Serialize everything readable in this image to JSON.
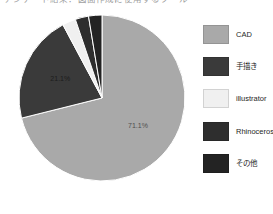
{
  "chart_data": {
    "type": "pie",
    "title": "アンケート結果：図面作成に使用するツール",
    "title_truncated": true,
    "categories": [
      "CAD",
      "手描き",
      "illustrator",
      "Rhinoceross",
      "その他"
    ],
    "values": [
      71.1,
      21.1,
      2.6,
      2.6,
      2.6
    ],
    "data_labels": [
      "71.1%",
      "21.1%",
      "",
      "",
      ""
    ],
    "visible_data_labels": [
      "71.1%",
      "21.1%"
    ],
    "colors": [
      "#a9a9a9",
      "#3a3a3a",
      "#f0f0f0",
      "#2e2e2e",
      "#232323"
    ],
    "legend": {
      "position": "right",
      "entries": [
        {
          "label": "CAD",
          "color": "#a9a9a9"
        },
        {
          "label": "手描き",
          "color": "#3a3a3a"
        },
        {
          "label": "illustrator",
          "color": "#f0f0f0"
        },
        {
          "label": "Rhinoceross",
          "color": "#2e2e2e"
        },
        {
          "label": "その他",
          "color": "#232323"
        }
      ]
    },
    "start_angle_deg": 0,
    "direction": "clockwise",
    "grid": false,
    "xlabel": "",
    "ylabel": ""
  }
}
